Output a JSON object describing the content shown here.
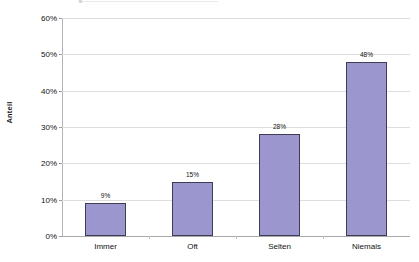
{
  "chart_data": {
    "type": "bar",
    "title": "",
    "xlabel": "",
    "ylabel": "Anteil",
    "categories": [
      "Immer",
      "Oft",
      "Selten",
      "Niemals"
    ],
    "values": [
      9,
      15,
      28,
      48
    ],
    "value_labels": [
      "9%",
      "15%",
      "28%",
      "48%"
    ],
    "ylim": [
      0,
      60
    ],
    "ytick_values": [
      0,
      10,
      20,
      30,
      40,
      50,
      60
    ],
    "ytick_labels": [
      "0%",
      "10%",
      "20%",
      "30%",
      "40%",
      "50%",
      "60%"
    ],
    "grid": true,
    "legend": "none",
    "series": [
      {
        "name": "Anteil",
        "values": [
          9,
          15,
          28,
          48
        ],
        "color": "#9c96ce",
        "border_color": "#3d3d54"
      }
    ],
    "colors": {
      "bar_fill": "#9c96ce",
      "bar_border": "#3d3d54",
      "gridline": "#dededf",
      "axis_line": "#a9a9ad",
      "background": "#ffffff",
      "text": "#111111"
    }
  }
}
